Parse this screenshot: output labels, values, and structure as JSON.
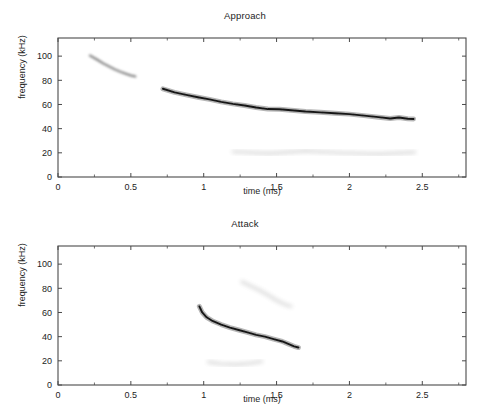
{
  "figure": {
    "background_color": "#ffffff",
    "axis_color": "#4a4a4a",
    "text_color": "#1d1d1d",
    "trace_color": "#111111"
  },
  "chart_data": [
    {
      "type": "heatmap",
      "name": "approach-spectrogram",
      "title": "Approach",
      "xlabel": "time (ms)",
      "ylabel": "frequency (kHz)",
      "xlim": [
        0,
        2.8
      ],
      "ylim": [
        0,
        115
      ],
      "grid": false,
      "legend": "none",
      "xticks": [
        0,
        0.5,
        1,
        1.5,
        2,
        2.5
      ],
      "xticklabels": [
        "0",
        "0.5",
        "1",
        "1.5",
        "2",
        "2.5"
      ],
      "xminorticks": [
        0.25,
        0.75,
        1.25,
        1.75,
        2.25,
        2.75
      ],
      "yticks": [
        0,
        20,
        40,
        60,
        80,
        100
      ],
      "yticklabels": [
        "0",
        "20",
        "40",
        "60",
        "80",
        "100"
      ],
      "colormap": "gray-inverted",
      "traces": [
        {
          "name": "harmonic-sweep-early",
          "intensity": "faint",
          "points": [
            [
              0.22,
              100.5
            ],
            [
              0.27,
              97.0
            ],
            [
              0.31,
              94.0
            ],
            [
              0.35,
              91.5
            ],
            [
              0.39,
              89.0
            ],
            [
              0.43,
              87.0
            ],
            [
              0.47,
              85.2
            ],
            [
              0.5,
              84.0
            ],
            [
              0.53,
              83.2
            ]
          ]
        },
        {
          "name": "fundamental-call-sweep",
          "intensity": "strong",
          "points": [
            [
              0.72,
              73.0
            ],
            [
              0.8,
              70.0
            ],
            [
              0.88,
              68.0
            ],
            [
              0.96,
              66.0
            ],
            [
              1.04,
              64.2
            ],
            [
              1.12,
              62.2
            ],
            [
              1.2,
              60.5
            ],
            [
              1.28,
              59.2
            ],
            [
              1.36,
              57.5
            ],
            [
              1.44,
              56.2
            ],
            [
              1.52,
              56.0
            ],
            [
              1.6,
              55.2
            ],
            [
              1.7,
              54.2
            ],
            [
              1.8,
              53.5
            ],
            [
              1.9,
              52.8
            ],
            [
              2.0,
              52.0
            ],
            [
              2.1,
              50.8
            ],
            [
              2.2,
              49.5
            ],
            [
              2.28,
              48.4
            ],
            [
              2.34,
              49.2
            ],
            [
              2.4,
              48.2
            ],
            [
              2.44,
              48.0
            ]
          ]
        },
        {
          "name": "low-frequency-noise-band",
          "intensity": "very-faint",
          "points": [
            [
              1.2,
              21.0
            ],
            [
              1.45,
              19.5
            ],
            [
              1.7,
              21.5
            ],
            [
              1.95,
              20.0
            ],
            [
              2.2,
              19.0
            ],
            [
              2.45,
              20.5
            ]
          ]
        }
      ]
    },
    {
      "type": "heatmap",
      "name": "attack-spectrogram",
      "title": "Attack",
      "xlabel": "time (ms)",
      "ylabel": "frequency (kHz)",
      "xlim": [
        0,
        2.8
      ],
      "ylim": [
        0,
        115
      ],
      "grid": false,
      "legend": "none",
      "xticks": [
        0,
        0.5,
        1,
        1.5,
        2,
        2.5
      ],
      "xticklabels": [
        "0",
        "0.5",
        "1",
        "1.5",
        "2",
        "2.5"
      ],
      "xminorticks": [
        0.25,
        0.75,
        1.25,
        1.75,
        2.25,
        2.75
      ],
      "yticks": [
        0,
        20,
        40,
        60,
        80,
        100
      ],
      "yticklabels": [
        "0",
        "20",
        "40",
        "60",
        "80",
        "100"
      ],
      "colormap": "gray-inverted",
      "traces": [
        {
          "name": "fundamental-call-sweep",
          "intensity": "strong",
          "points": [
            [
              0.97,
              65.0
            ],
            [
              0.99,
              60.0
            ],
            [
              1.02,
              56.0
            ],
            [
              1.06,
              53.0
            ],
            [
              1.12,
              50.0
            ],
            [
              1.18,
              47.5
            ],
            [
              1.24,
              45.5
            ],
            [
              1.3,
              43.5
            ],
            [
              1.36,
              41.5
            ],
            [
              1.42,
              40.0
            ],
            [
              1.48,
              38.0
            ],
            [
              1.54,
              36.0
            ],
            [
              1.58,
              34.0
            ],
            [
              1.62,
              32.0
            ],
            [
              1.65,
              31.0
            ]
          ]
        },
        {
          "name": "harmonic-sweep-upper",
          "intensity": "very-faint",
          "points": [
            [
              1.26,
              85.5
            ],
            [
              1.32,
              82.0
            ],
            [
              1.38,
              78.5
            ],
            [
              1.44,
              74.5
            ],
            [
              1.5,
              70.0
            ],
            [
              1.56,
              66.5
            ],
            [
              1.6,
              65.0
            ]
          ]
        },
        {
          "name": "low-frequency-noise-band",
          "intensity": "very-faint",
          "points": [
            [
              1.03,
              19.0
            ],
            [
              1.12,
              17.5
            ],
            [
              1.22,
              17.0
            ],
            [
              1.32,
              18.0
            ],
            [
              1.4,
              19.5
            ]
          ]
        }
      ]
    }
  ],
  "panels": [
    {
      "id": "approach",
      "title": "Approach",
      "xlabel": "time (ms)",
      "ylabel": "frequency (kHz)"
    },
    {
      "id": "attack",
      "title": "Attack",
      "xlabel": "time (ms)",
      "ylabel": "frequency (kHz)"
    }
  ]
}
